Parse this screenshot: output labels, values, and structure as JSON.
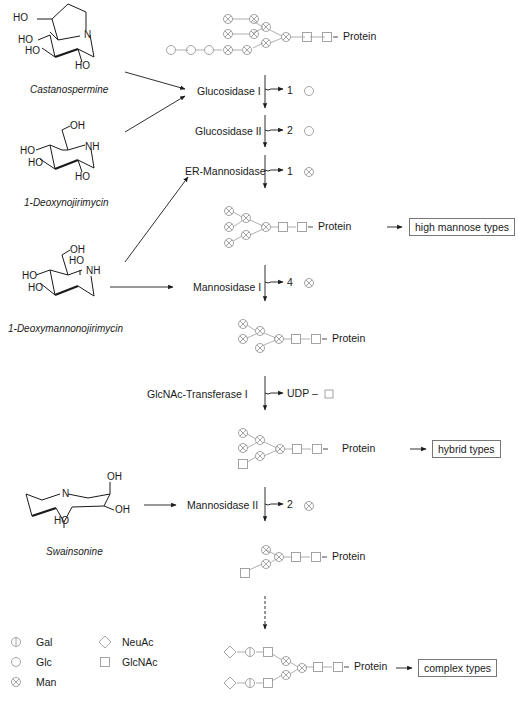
{
  "inhibitors": [
    {
      "name": "Castanospermine",
      "atoms": [
        "HO",
        "HO",
        "HO",
        "HO",
        "N"
      ]
    },
    {
      "name": "1-Deoxynojirimycin",
      "atoms": [
        "OH",
        "HO",
        "HO",
        "HO",
        "NH"
      ]
    },
    {
      "name": "1-Deoxymannonojirimycin",
      "atoms": [
        "OH",
        "HO",
        "HO",
        "HO",
        "NH"
      ]
    },
    {
      "name": "Swainsonine",
      "atoms": [
        "OH",
        "OH",
        "HO",
        "N"
      ]
    }
  ],
  "steps": [
    {
      "enzyme": "Glucosidase  I",
      "released_count": "1",
      "released_sugar": "Glc"
    },
    {
      "enzyme": "Glucosidase  II",
      "released_count": "2",
      "released_sugar": "Glc"
    },
    {
      "enzyme": "ER-Mannosidase",
      "released_count": "1",
      "released_sugar": "Man"
    },
    {
      "enzyme": "Mannosidase  I",
      "released_count": "4",
      "released_sugar": "Man"
    },
    {
      "enzyme": "GlcNAc-Transferase  I",
      "released_count": "UDP –",
      "released_sugar": "GlcNAc"
    },
    {
      "enzyme": "Mannosidase  II",
      "released_count": "2",
      "released_sugar": "Man"
    }
  ],
  "protein_label": "Protein",
  "outcomes": {
    "high_mannose": "high mannose types",
    "hybrid": "hybrid types",
    "complex": "complex types"
  },
  "legend": [
    {
      "symbol": "Gal",
      "label": "Gal"
    },
    {
      "symbol": "NeuAc",
      "label": "NeuAc"
    },
    {
      "symbol": "Glc",
      "label": "Glc"
    },
    {
      "symbol": "GlcNAc",
      "label": "GlcNAc"
    },
    {
      "symbol": "Man",
      "label": "Man"
    }
  ],
  "colors": {
    "symbol": "#9a9a9a",
    "line": "#1a1a1a",
    "box_border": "#777777"
  }
}
